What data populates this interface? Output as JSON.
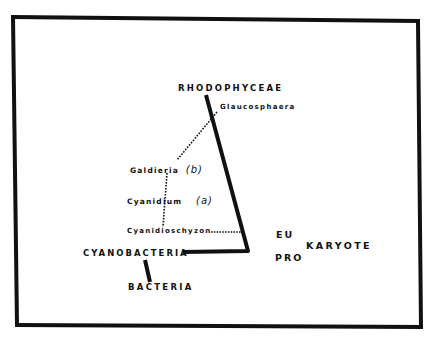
{
  "diagram": {
    "type": "phylogeny-sketch",
    "nodes": {
      "rhodophyceae": "RHODOPHYCEAE",
      "glaucosphaera": "Glaucosphaera",
      "galdieria": "Galdieria",
      "galdieria_mark": "(b)",
      "cyanidium": "Cyanidium",
      "cyanidium_mark": "(a)",
      "cyanidioschyzon": "Cyanidioschyzon",
      "cyanobacteria": "CYANOBACTERIA",
      "bacteria": "BACTERIA",
      "eu": "EU",
      "pro": "PRO",
      "karyote": "KARYOTE"
    },
    "edges": [
      {
        "from": "CYANOBACTERIA",
        "to": "RHODOPHYCEAE",
        "style": "thick-solid",
        "path": "horizontal then diagonal up"
      },
      {
        "from": "BACTERIA",
        "to": "CYANOBACTERIA",
        "style": "thick-solid"
      },
      {
        "from": "Glaucosphaera",
        "to": "Galdieria",
        "style": "dotted"
      },
      {
        "from": "Galdieria",
        "to": "Cyanidioschyzon",
        "style": "dotted",
        "via": "Cyanidium"
      },
      {
        "from": "Cyanidioschyzon",
        "to": "main-branch",
        "style": "dotted"
      }
    ],
    "colors": {
      "ink": "#111111",
      "paper": "#ffffff"
    }
  }
}
